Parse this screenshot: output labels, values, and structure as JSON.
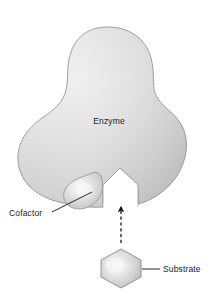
{
  "figure": {
    "background_color": "#ffffff",
    "width": 218,
    "height": 299
  },
  "labels": {
    "enzyme": "Enzyme",
    "cofactor": "Cofactor",
    "substrate": "Substrate"
  },
  "colors": {
    "enzyme_fill_light": "#e9e9e9",
    "enzyme_fill_mid": "#d2d2d2",
    "enzyme_fill_dark": "#bdbdbd",
    "enzyme_outline": "#8e8e8e",
    "cofactor_highlight": "#f2f2f2",
    "cofactor_fill": "#c6c6c6",
    "cofactor_outline": "#909090",
    "substrate_highlight": "#f4f4f4",
    "substrate_fill": "#c2c2c2",
    "substrate_outline": "#8a8a8a",
    "arrow_color": "#111111",
    "label_color": "#1a1a1a",
    "leader_color": "#111111"
  },
  "parts": [
    {
      "name": "enzyme",
      "label": "Enzyme",
      "description": "large irregular globular protein body with an active site notch at its base"
    },
    {
      "name": "cofactor",
      "label": "Cofactor",
      "description": "small rounded bump bound to the lower left of the enzyme near the active site"
    },
    {
      "name": "active-site",
      "label": "",
      "description": "pentagonal notch cut into the bottom of the enzyme matching the substrate shape"
    },
    {
      "name": "substrate",
      "label": "Substrate",
      "description": "hexagonal molecule positioned below the enzyme active site"
    },
    {
      "name": "binding-arrow",
      "label": "",
      "description": "dashed arrow pointing upward from the substrate into the active site"
    }
  ],
  "icons": {
    "arrow_up": "arrow-up-icon",
    "hexagon": "hexagon-icon"
  }
}
